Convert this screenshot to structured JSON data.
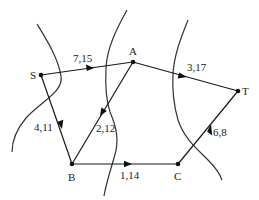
{
  "diagram": {
    "type": "directed-network-with-cuts",
    "nodes": [
      {
        "id": "S",
        "label": "S",
        "x": 41,
        "y": 75
      },
      {
        "id": "A",
        "label": "A",
        "x": 133,
        "y": 62
      },
      {
        "id": "T",
        "label": "T",
        "x": 238,
        "y": 91
      },
      {
        "id": "B",
        "label": "B",
        "x": 72,
        "y": 164
      },
      {
        "id": "C",
        "label": "C",
        "x": 178,
        "y": 164
      }
    ],
    "edges": [
      {
        "from": "S",
        "to": "A",
        "label": "7,15"
      },
      {
        "from": "A",
        "to": "T",
        "label": "3,17"
      },
      {
        "from": "S",
        "to": "B",
        "label": "4,11"
      },
      {
        "from": "A",
        "to": "B",
        "label": "2,12"
      },
      {
        "from": "B",
        "to": "C",
        "label": "1,14"
      },
      {
        "from": "C",
        "to": "T",
        "label": "6,8"
      }
    ],
    "cuts": [
      {
        "name": "cut-1"
      },
      {
        "name": "cut-2"
      },
      {
        "name": "cut-3"
      }
    ]
  }
}
